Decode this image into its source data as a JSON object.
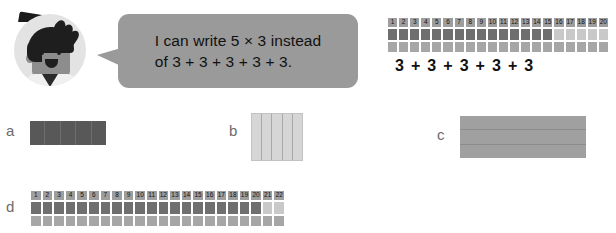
{
  "speech": {
    "character": "boy-avatar",
    "line1": "I can write 5 × 3 instead",
    "line2": "of 3 + 3 + 3 + 3 + 3."
  },
  "reference": {
    "numbers": [
      "1",
      "2",
      "3",
      "4",
      "5",
      "6",
      "7",
      "8",
      "9",
      "10",
      "11",
      "12",
      "13",
      "14",
      "15",
      "16",
      "17",
      "18",
      "19",
      "20"
    ],
    "equation": "3 + 3 + 3 + 3 + 3",
    "total_cells": 20,
    "shaded_cells": 15,
    "group_size": 3,
    "group_count": 5
  },
  "options": [
    {
      "label": "a",
      "shape": "dark-bar-5-columns",
      "columns": 5,
      "rows": 1
    },
    {
      "label": "b",
      "shape": "light-square-5-columns",
      "columns": 5,
      "rows": 1
    },
    {
      "label": "c",
      "shape": "gray-bar-3-rows",
      "columns": 1,
      "rows": 3
    },
    {
      "label": "d",
      "shape": "number-strip-22",
      "numbers": [
        "1",
        "2",
        "3",
        "4",
        "5",
        "6",
        "7",
        "8",
        "9",
        "10",
        "11",
        "12",
        "13",
        "14",
        "15",
        "16",
        "17",
        "18",
        "19",
        "20",
        "21",
        "22"
      ],
      "total_cells": 22,
      "shaded_cells": 20
    }
  ],
  "colors": {
    "bubble": "#9a9a9a",
    "avatar_bg": "#e3e3e3",
    "strip_number_bg": "#9e9e9e",
    "fill_dark": "#6f6f6f",
    "fill_mid": "#a6a6a6",
    "fill_light": "#c9c9c9",
    "option_a": "#585858",
    "option_b": "#d6d6d6",
    "option_c": "#a0a0a0",
    "label_text": "#6b6b6b"
  }
}
